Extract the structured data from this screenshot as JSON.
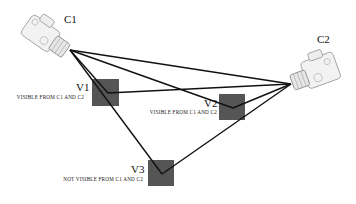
{
  "cameras": [
    {
      "id": "C1",
      "label": "C1",
      "lens": [
        70,
        50
      ],
      "label_pos": [
        64,
        14
      ]
    },
    {
      "id": "C2",
      "label": "C2",
      "lens": [
        291,
        84
      ],
      "label_pos": [
        317,
        34
      ]
    }
  ],
  "voxels": [
    {
      "id": "V1",
      "label": "V1",
      "caption": "Visible from C1 and C2",
      "box": [
        92,
        79,
        27,
        27
      ],
      "vertex": [
        108,
        93
      ]
    },
    {
      "id": "V2",
      "label": "V2",
      "caption": "Visible from C1 and C2",
      "box": [
        219,
        94,
        26,
        26
      ],
      "vertex": [
        233,
        108
      ]
    },
    {
      "id": "V3",
      "label": "V3",
      "caption": "Not Visible From C1 and C2",
      "box": [
        148,
        160,
        26,
        26
      ],
      "vertex": [
        162,
        174
      ]
    }
  ],
  "colors": {
    "box": "#555555",
    "line": "#111111"
  }
}
